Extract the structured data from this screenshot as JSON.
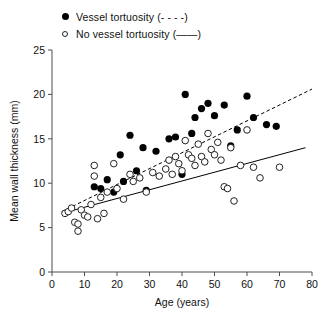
{
  "legend": {
    "position": "top-left",
    "items": [
      {
        "marker": "filled-circle-marker",
        "label": "Vessel tortuosity (- - - -)"
      },
      {
        "marker": "open-circle-marker",
        "label": "No vessel tortuosity (——)"
      }
    ]
  },
  "chart_data": {
    "type": "scatter",
    "title": "",
    "xlabel": "Age (years)",
    "ylabel": "Mean wall thickness (mm)",
    "xlim": [
      0,
      80
    ],
    "ylim": [
      0,
      25
    ],
    "xticks": [
      0,
      10,
      20,
      30,
      40,
      50,
      60,
      70,
      80
    ],
    "yticks": [
      0,
      5,
      10,
      15,
      20,
      25
    ],
    "grid": false,
    "series": [
      {
        "name": "Vessel tortuosity",
        "marker": "filled-circle",
        "color": "#000000",
        "fit_line_style": "dashed",
        "points": [
          [
            13,
            9.6
          ],
          [
            15,
            9.4
          ],
          [
            17,
            10.4
          ],
          [
            19,
            9.0
          ],
          [
            21,
            13.2
          ],
          [
            22,
            10.2
          ],
          [
            24,
            15.4
          ],
          [
            26,
            11.4
          ],
          [
            28,
            14.0
          ],
          [
            29,
            9.2
          ],
          [
            32,
            13.6
          ],
          [
            36,
            15.0
          ],
          [
            38,
            15.2
          ],
          [
            40,
            11.0
          ],
          [
            41,
            20.0
          ],
          [
            43,
            15.6
          ],
          [
            44,
            17.4
          ],
          [
            46,
            18.4
          ],
          [
            48,
            19.0
          ],
          [
            50,
            17.6
          ],
          [
            53,
            18.8
          ],
          [
            55,
            14.2
          ],
          [
            57,
            16.0
          ],
          [
            60,
            19.8
          ],
          [
            62,
            17.4
          ],
          [
            66,
            16.6
          ],
          [
            69,
            16.4
          ]
        ],
        "fit_line": {
          "x": [
            3,
            80
          ],
          "y": [
            6.8,
            20.6
          ]
        }
      },
      {
        "name": "No vessel tortuosity",
        "marker": "open-circle",
        "color": "#222222",
        "fit_line_style": "solid",
        "points": [
          [
            4,
            6.6
          ],
          [
            5,
            6.8
          ],
          [
            6,
            7.2
          ],
          [
            7,
            5.6
          ],
          [
            8,
            5.4
          ],
          [
            8,
            4.6
          ],
          [
            9,
            7.0
          ],
          [
            10,
            6.4
          ],
          [
            11,
            6.2
          ],
          [
            12,
            7.6
          ],
          [
            13,
            12.0
          ],
          [
            13,
            10.8
          ],
          [
            14,
            6.0
          ],
          [
            15,
            8.4
          ],
          [
            16,
            6.6
          ],
          [
            17,
            9.0
          ],
          [
            19,
            12.2
          ],
          [
            20,
            9.4
          ],
          [
            22,
            8.2
          ],
          [
            24,
            11.0
          ],
          [
            25,
            10.2
          ],
          [
            27,
            10.6
          ],
          [
            29,
            9.0
          ],
          [
            31,
            11.2
          ],
          [
            33,
            10.8
          ],
          [
            35,
            11.6
          ],
          [
            36,
            12.6
          ],
          [
            37,
            11.0
          ],
          [
            38,
            13.0
          ],
          [
            39,
            12.2
          ],
          [
            40,
            11.4
          ],
          [
            41,
            14.8
          ],
          [
            42,
            13.2
          ],
          [
            43,
            12.8
          ],
          [
            44,
            12.0
          ],
          [
            45,
            14.4
          ],
          [
            46,
            13.0
          ],
          [
            47,
            12.4
          ],
          [
            48,
            15.6
          ],
          [
            49,
            13.8
          ],
          [
            50,
            13.2
          ],
          [
            51,
            14.6
          ],
          [
            52,
            12.6
          ],
          [
            53,
            9.6
          ],
          [
            54,
            9.4
          ],
          [
            55,
            14.0
          ],
          [
            56,
            8.0
          ],
          [
            58,
            12.0
          ],
          [
            60,
            16.0
          ],
          [
            62,
            11.8
          ],
          [
            64,
            10.6
          ],
          [
            70,
            11.8
          ]
        ],
        "fit_line": {
          "x": [
            3,
            78
          ],
          "y": [
            6.6,
            14.0
          ]
        }
      }
    ]
  }
}
